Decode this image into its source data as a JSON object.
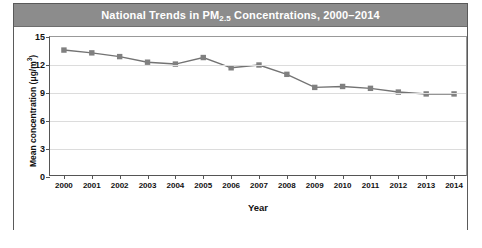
{
  "figure": {
    "title_main": "National Trends in PM",
    "title_sub": "2.5",
    "title_rest": " Concentrations, 2000–2014",
    "title_full": "National Trends in PM2.5 Concentrations, 2000–2014"
  },
  "axes": {
    "ylabel_main": "Mean concentration (μg/m",
    "ylabel_sup": "3",
    "ylabel_tail": ")",
    "xlabel": "Year"
  },
  "colors": {
    "title_bar": "#8c8c8c",
    "title_text": "#ffffff",
    "line": "#737373",
    "marker": "#808080",
    "grid": "#dcdcdc",
    "axis": "#555555",
    "frame": "#5a5a5a"
  },
  "chart_data": {
    "type": "line",
    "title": "National Trends in PM2.5 Concentrations, 2000–2014",
    "xlabel": "Year",
    "ylabel": "Mean concentration (μg/m3)",
    "categories": [
      "2000",
      "2001",
      "2002",
      "2003",
      "2004",
      "2005",
      "2006",
      "2007",
      "2008",
      "2009",
      "2010",
      "2011",
      "2012",
      "2013",
      "2014"
    ],
    "values": [
      13.6,
      13.3,
      12.9,
      12.3,
      12.1,
      12.8,
      11.7,
      12.0,
      11.0,
      9.6,
      9.7,
      9.5,
      9.1,
      8.9,
      8.9
    ],
    "series": [
      {
        "name": "Mean PM2.5 concentration",
        "values": [
          13.6,
          13.3,
          12.9,
          12.3,
          12.1,
          12.8,
          11.7,
          12.0,
          11.0,
          9.6,
          9.7,
          9.5,
          9.1,
          8.9,
          8.9
        ]
      }
    ],
    "yticks": [
      0,
      3,
      6,
      9,
      12,
      15
    ],
    "ylim": [
      0,
      15
    ],
    "xlim": [
      "2000",
      "2014"
    ],
    "grid": true,
    "legend": false,
    "marker": "square"
  }
}
